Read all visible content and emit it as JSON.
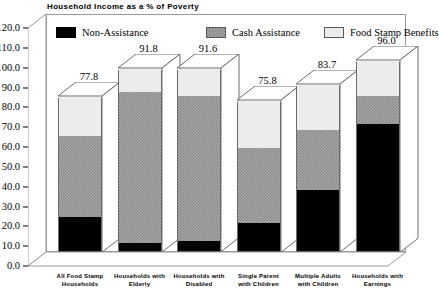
{
  "chart_data": {
    "type": "bar",
    "subtype": "stacked-bar-3d",
    "title": "Household Income as a % of Poverty",
    "xlabel": "",
    "ylabel": "",
    "ylim": [
      0.0,
      120.0
    ],
    "ytick_step": 10.0,
    "yticks": [
      "0.0",
      "10.0",
      "20.0",
      "30.0",
      "40.0",
      "50.0",
      "60.0",
      "70.0",
      "80.0",
      "90.0",
      "100.0",
      "110.0",
      "120.0"
    ],
    "grid": false,
    "legend_position": "top-inside",
    "categories": [
      "All Food Stamp Households",
      "Households with Elderly",
      "Households with Disabled",
      "Single Parent with Children",
      "Multiple Adults with Children",
      "Households with Earnings"
    ],
    "category_lines": [
      [
        "All Food Stamp",
        "Households"
      ],
      [
        "Households with",
        "Elderly"
      ],
      [
        "Households with",
        "Disabled"
      ],
      [
        "Single Parent",
        "with Children"
      ],
      [
        "Multiple Adults",
        "with Children"
      ],
      [
        "Households with",
        "Earnings"
      ]
    ],
    "series": [
      {
        "name": "Non-Assistance",
        "color": "#000000",
        "values": [
          17.0,
          4.0,
          5.0,
          14.0,
          31.0,
          64.0
        ]
      },
      {
        "name": "Cash Assistance",
        "color": "#a9a9a9",
        "values": [
          41.0,
          76.0,
          73.0,
          38.0,
          30.0,
          14.0
        ]
      },
      {
        "name": "Food Stamp Benefits",
        "color": "#ececec",
        "values": [
          19.8,
          11.8,
          13.6,
          23.8,
          22.7,
          18.0
        ]
      }
    ],
    "totals": [
      77.8,
      91.8,
      91.6,
      75.8,
      83.7,
      96.0
    ],
    "total_labels": [
      "77.8",
      "91.8",
      "91.6",
      "75.8",
      "83.7",
      "96.0"
    ]
  },
  "legend": {
    "items": [
      {
        "label": "Non-Assistance"
      },
      {
        "label": "Cash Assistance"
      },
      {
        "label": "Food Stamp Benefits"
      }
    ]
  }
}
